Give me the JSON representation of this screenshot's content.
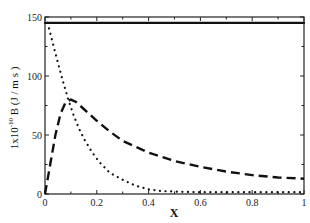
{
  "chart_data": {
    "type": "line",
    "title": "",
    "xlabel": "X",
    "ylabel": "1x10^-10 B (J / m s)",
    "ylabel_parts": {
      "prefix": "1x10",
      "exponent": "-10",
      "suffix": " B (J / m s )"
    },
    "xlim": [
      0,
      1
    ],
    "ylim": [
      0,
      150
    ],
    "x_ticks": [
      0,
      0.2,
      0.4,
      0.6,
      0.8,
      1
    ],
    "x_tick_labels": [
      "0",
      "0.2",
      "0.4",
      "0.6",
      "0.8",
      "1"
    ],
    "y_ticks": [
      0,
      50,
      100,
      150
    ],
    "y_tick_labels": [
      "0",
      "50",
      "100",
      "150"
    ],
    "grid": false,
    "legend": null,
    "series": [
      {
        "name": "solid",
        "style": "solid",
        "x": [
          0,
          0.2,
          0.4,
          0.6,
          0.8,
          1.0
        ],
        "y": [
          145,
          145,
          145,
          145,
          145,
          145
        ]
      },
      {
        "name": "dotted",
        "style": "dotted",
        "x": [
          0.01,
          0.03,
          0.05,
          0.07,
          0.09,
          0.11,
          0.13,
          0.15,
          0.18,
          0.21,
          0.25,
          0.3,
          0.35,
          0.4,
          0.45,
          0.5,
          0.6,
          0.7,
          0.8,
          0.9,
          1.0
        ],
        "y": [
          145,
          128,
          111,
          95,
          80,
          67,
          56,
          47,
          36,
          27,
          18,
          12,
          7,
          4,
          2.5,
          2,
          1.5,
          1.5,
          1.5,
          1.5,
          1.5
        ]
      },
      {
        "name": "dashed",
        "style": "dashed",
        "x": [
          0,
          0.02,
          0.04,
          0.06,
          0.08,
          0.1,
          0.12,
          0.15,
          0.2,
          0.25,
          0.3,
          0.4,
          0.5,
          0.6,
          0.7,
          0.8,
          0.9,
          1.0
        ],
        "y": [
          0,
          25,
          50,
          68,
          78,
          80,
          78,
          72,
          62,
          53,
          45,
          35,
          28,
          23,
          19,
          16,
          14,
          13
        ]
      }
    ]
  }
}
